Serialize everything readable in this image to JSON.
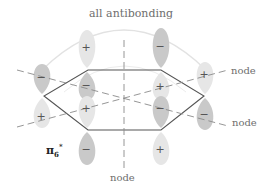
{
  "title": "all antibonding",
  "orbital_label": {
    "base": "π",
    "sub": "6",
    "sup": "*"
  },
  "node_labels": [
    "node",
    "node",
    "node"
  ],
  "colors": {
    "light_lobe": "#e6e6e6",
    "dark_lobe": "#c9c9c9",
    "hexagon": "#555555",
    "dashed": "#8a8a8a",
    "arc": "#e0e0e0"
  },
  "lobes": [
    {
      "atom": "top-left",
      "upper_sign": "+",
      "lower_sign": "−"
    },
    {
      "atom": "top-right",
      "upper_sign": "−",
      "lower_sign": "+"
    },
    {
      "atom": "right",
      "upper_sign": "+",
      "lower_sign": "−"
    },
    {
      "atom": "bottom-right",
      "upper_sign": "−",
      "lower_sign": "+"
    },
    {
      "atom": "bottom-left",
      "upper_sign": "+",
      "lower_sign": "−"
    },
    {
      "atom": "left",
      "upper_sign": "−",
      "lower_sign": "+"
    }
  ]
}
